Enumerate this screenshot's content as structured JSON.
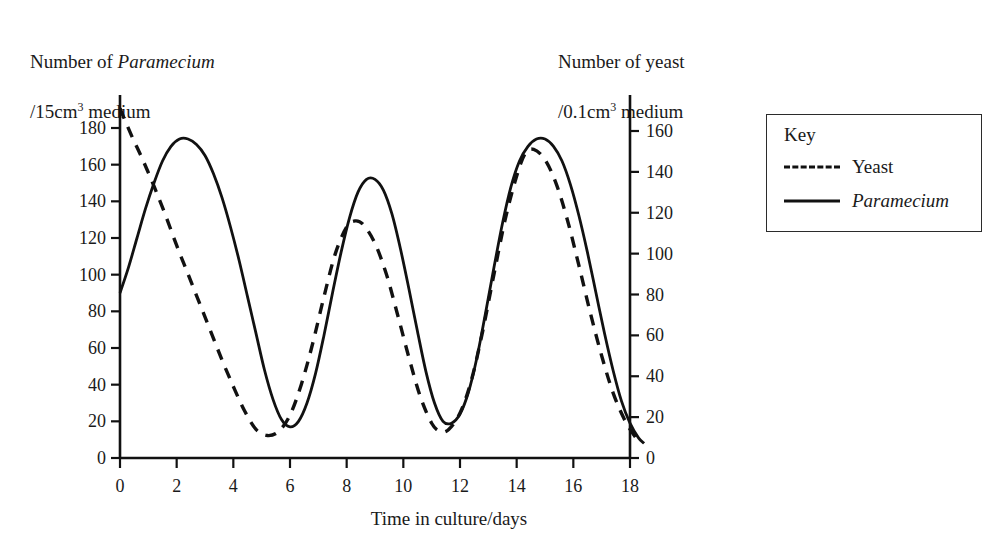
{
  "chart_data": {
    "type": "line",
    "title": "",
    "xlabel": "Time in culture/days",
    "ylabel_left": "Number of Paramecium /15 cm3 medium",
    "ylabel_right": "Number of yeast /0.1 cm3 medium",
    "xlim": [
      0,
      18.6
    ],
    "xticks": [
      0,
      2,
      4,
      6,
      8,
      10,
      12,
      14,
      16,
      18
    ],
    "ylim_left": [
      0,
      186
    ],
    "yticks_left": [
      0,
      20,
      40,
      60,
      80,
      100,
      120,
      140,
      160,
      180
    ],
    "ylim_right": [
      0,
      166
    ],
    "yticks_right": [
      0,
      20,
      40,
      60,
      80,
      100,
      120,
      140,
      160
    ],
    "grid": false,
    "legend_position": "outside-right",
    "series": [
      {
        "name": "Yeast",
        "style": "dashed",
        "axis": "right",
        "points": [
          [
            0.0,
            171
          ],
          [
            0.4,
            158
          ],
          [
            0.8,
            146
          ],
          [
            1.2,
            133
          ],
          [
            1.6,
            119
          ],
          [
            2.0,
            104
          ],
          [
            2.4,
            90
          ],
          [
            2.8,
            76
          ],
          [
            3.2,
            62
          ],
          [
            3.6,
            48
          ],
          [
            4.0,
            35
          ],
          [
            4.4,
            23
          ],
          [
            4.8,
            14
          ],
          [
            5.2,
            11
          ],
          [
            5.6,
            13
          ],
          [
            6.0,
            21
          ],
          [
            6.4,
            36
          ],
          [
            6.8,
            56
          ],
          [
            7.2,
            79
          ],
          [
            7.6,
            100
          ],
          [
            8.0,
            113
          ],
          [
            8.3,
            116
          ],
          [
            8.6,
            114
          ],
          [
            9.0,
            105
          ],
          [
            9.4,
            90
          ],
          [
            9.8,
            70
          ],
          [
            10.2,
            49
          ],
          [
            10.6,
            30
          ],
          [
            11.0,
            17
          ],
          [
            11.3,
            13
          ],
          [
            11.6,
            14
          ],
          [
            12.0,
            22
          ],
          [
            12.4,
            38
          ],
          [
            12.8,
            62
          ],
          [
            13.2,
            90
          ],
          [
            13.6,
            117
          ],
          [
            14.0,
            138
          ],
          [
            14.3,
            149
          ],
          [
            14.6,
            151
          ],
          [
            15.0,
            146
          ],
          [
            15.4,
            134
          ],
          [
            15.8,
            116
          ],
          [
            16.2,
            94
          ],
          [
            16.6,
            71
          ],
          [
            17.0,
            50
          ],
          [
            17.4,
            32
          ],
          [
            17.8,
            19
          ],
          [
            18.2,
            10
          ],
          [
            18.4,
            7
          ]
        ]
      },
      {
        "name": "Paramecium",
        "style": "solid",
        "axis": "left",
        "points": [
          [
            0.0,
            90
          ],
          [
            0.3,
            104
          ],
          [
            0.6,
            120
          ],
          [
            0.9,
            136
          ],
          [
            1.2,
            150
          ],
          [
            1.5,
            162
          ],
          [
            1.8,
            170
          ],
          [
            2.1,
            174
          ],
          [
            2.4,
            174
          ],
          [
            2.7,
            171
          ],
          [
            3.0,
            165
          ],
          [
            3.3,
            155
          ],
          [
            3.6,
            142
          ],
          [
            3.9,
            126
          ],
          [
            4.2,
            108
          ],
          [
            4.5,
            88
          ],
          [
            4.8,
            68
          ],
          [
            5.1,
            48
          ],
          [
            5.4,
            32
          ],
          [
            5.7,
            21
          ],
          [
            6.0,
            17
          ],
          [
            6.3,
            20
          ],
          [
            6.6,
            30
          ],
          [
            6.9,
            46
          ],
          [
            7.2,
            67
          ],
          [
            7.5,
            90
          ],
          [
            7.8,
            112
          ],
          [
            8.1,
            131
          ],
          [
            8.4,
            145
          ],
          [
            8.7,
            152
          ],
          [
            9.0,
            152
          ],
          [
            9.3,
            146
          ],
          [
            9.6,
            133
          ],
          [
            9.9,
            114
          ],
          [
            10.2,
            92
          ],
          [
            10.5,
            69
          ],
          [
            10.8,
            47
          ],
          [
            11.1,
            30
          ],
          [
            11.4,
            20
          ],
          [
            11.7,
            19
          ],
          [
            12.0,
            24
          ],
          [
            12.3,
            36
          ],
          [
            12.6,
            55
          ],
          [
            12.9,
            79
          ],
          [
            13.2,
            104
          ],
          [
            13.5,
            128
          ],
          [
            13.8,
            148
          ],
          [
            14.1,
            162
          ],
          [
            14.4,
            170
          ],
          [
            14.7,
            174
          ],
          [
            15.0,
            174
          ],
          [
            15.3,
            170
          ],
          [
            15.6,
            162
          ],
          [
            15.9,
            149
          ],
          [
            16.2,
            132
          ],
          [
            16.5,
            112
          ],
          [
            16.8,
            90
          ],
          [
            17.1,
            68
          ],
          [
            17.4,
            48
          ],
          [
            17.7,
            31
          ],
          [
            18.0,
            19
          ],
          [
            18.3,
            11
          ],
          [
            18.5,
            8
          ]
        ]
      }
    ]
  },
  "labels": {
    "ylabel_left_line1_pre": "Number of ",
    "ylabel_left_line1_it": "Paramecium",
    "ylabel_left_line2_pre": "/15",
    "ylabel_left_line2_unit": "cm",
    "ylabel_left_line2_sup": "3",
    "ylabel_left_line2_post": " medium",
    "ylabel_right_line1": "Number of yeast",
    "ylabel_right_line2_pre": "/0.1",
    "ylabel_right_line2_unit": "cm",
    "ylabel_right_line2_sup": "3",
    "ylabel_right_line2_post": " medium",
    "xlabel": "Time in culture/days"
  },
  "key": {
    "title": "Key",
    "entries": [
      {
        "label": "Yeast",
        "style": "dashed",
        "italic": false
      },
      {
        "label": "Paramecium",
        "style": "solid",
        "italic": true
      }
    ]
  }
}
